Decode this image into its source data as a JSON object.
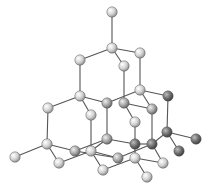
{
  "diagram": {
    "type": "ball-and-stick",
    "colors": {
      "background": "#ffffff",
      "bond": "#555555",
      "atom_light": "#d4d4d4",
      "atom_mid": "#a8a8a8",
      "atom_dark": "#6e6e6e",
      "atom_outline": "#5a5a5a"
    },
    "atom_radius": 5.2,
    "atoms": [
      {
        "id": 0,
        "x": 112,
        "y": 12,
        "shade": "light"
      },
      {
        "id": 1,
        "x": 112,
        "y": 48,
        "shade": "light"
      },
      {
        "id": 2,
        "x": 80,
        "y": 60,
        "shade": "light"
      },
      {
        "id": 3,
        "x": 140,
        "y": 53,
        "shade": "light"
      },
      {
        "id": 4,
        "x": 124,
        "y": 66,
        "shade": "light"
      },
      {
        "id": 5,
        "x": 80,
        "y": 96,
        "shade": "light"
      },
      {
        "id": 6,
        "x": 140,
        "y": 90,
        "shade": "light"
      },
      {
        "id": 7,
        "x": 48,
        "y": 108,
        "shade": "light"
      },
      {
        "id": 8,
        "x": 91,
        "y": 115,
        "shade": "light"
      },
      {
        "id": 9,
        "x": 107,
        "y": 103,
        "shade": "mid"
      },
      {
        "id": 10,
        "x": 124,
        "y": 103,
        "shade": "mid"
      },
      {
        "id": 11,
        "x": 168,
        "y": 96,
        "shade": "dark"
      },
      {
        "id": 12,
        "x": 152,
        "y": 109,
        "shade": "mid"
      },
      {
        "id": 13,
        "x": 135,
        "y": 122,
        "shade": "light"
      },
      {
        "id": 14,
        "x": 47,
        "y": 144,
        "shade": "light"
      },
      {
        "id": 15,
        "x": 15,
        "y": 157,
        "shade": "light"
      },
      {
        "id": 16,
        "x": 75,
        "y": 151,
        "shade": "mid"
      },
      {
        "id": 17,
        "x": 91,
        "y": 151,
        "shade": "light"
      },
      {
        "id": 18,
        "x": 59,
        "y": 163,
        "shade": "light"
      },
      {
        "id": 19,
        "x": 107,
        "y": 139,
        "shade": "mid"
      },
      {
        "id": 20,
        "x": 167,
        "y": 132,
        "shade": "dark"
      },
      {
        "id": 21,
        "x": 196,
        "y": 139,
        "shade": "dark"
      },
      {
        "id": 22,
        "x": 135,
        "y": 144,
        "shade": "dark"
      },
      {
        "id": 23,
        "x": 152,
        "y": 144,
        "shade": "dark"
      },
      {
        "id": 24,
        "x": 179,
        "y": 151,
        "shade": "dark"
      },
      {
        "id": 25,
        "x": 118,
        "y": 158,
        "shade": "mid"
      },
      {
        "id": 26,
        "x": 135,
        "y": 158,
        "shade": "light"
      },
      {
        "id": 27,
        "x": 163,
        "y": 163,
        "shade": "light"
      },
      {
        "id": 28,
        "x": 103,
        "y": 170,
        "shade": "light"
      },
      {
        "id": 29,
        "x": 147,
        "y": 177,
        "shade": "light"
      }
    ],
    "bonds": [
      [
        0,
        1
      ],
      [
        1,
        2
      ],
      [
        1,
        3
      ],
      [
        1,
        4
      ],
      [
        2,
        5
      ],
      [
        3,
        6
      ],
      [
        4,
        10
      ],
      [
        5,
        7
      ],
      [
        5,
        8
      ],
      [
        5,
        9
      ],
      [
        6,
        9
      ],
      [
        6,
        11
      ],
      [
        6,
        12
      ],
      [
        10,
        12
      ],
      [
        10,
        13
      ],
      [
        7,
        14
      ],
      [
        8,
        17
      ],
      [
        9,
        19
      ],
      [
        12,
        23
      ],
      [
        11,
        20
      ],
      [
        13,
        22
      ],
      [
        14,
        15
      ],
      [
        14,
        16
      ],
      [
        14,
        18
      ],
      [
        18,
        17
      ],
      [
        16,
        19
      ],
      [
        17,
        19
      ],
      [
        17,
        25
      ],
      [
        17,
        28
      ],
      [
        19,
        22
      ],
      [
        22,
        23
      ],
      [
        23,
        20
      ],
      [
        20,
        21
      ],
      [
        20,
        24
      ],
      [
        22,
        26
      ],
      [
        25,
        23
      ],
      [
        28,
        26
      ],
      [
        26,
        29
      ],
      [
        26,
        27
      ],
      [
        23,
        27
      ],
      [
        16,
        25
      ]
    ]
  }
}
